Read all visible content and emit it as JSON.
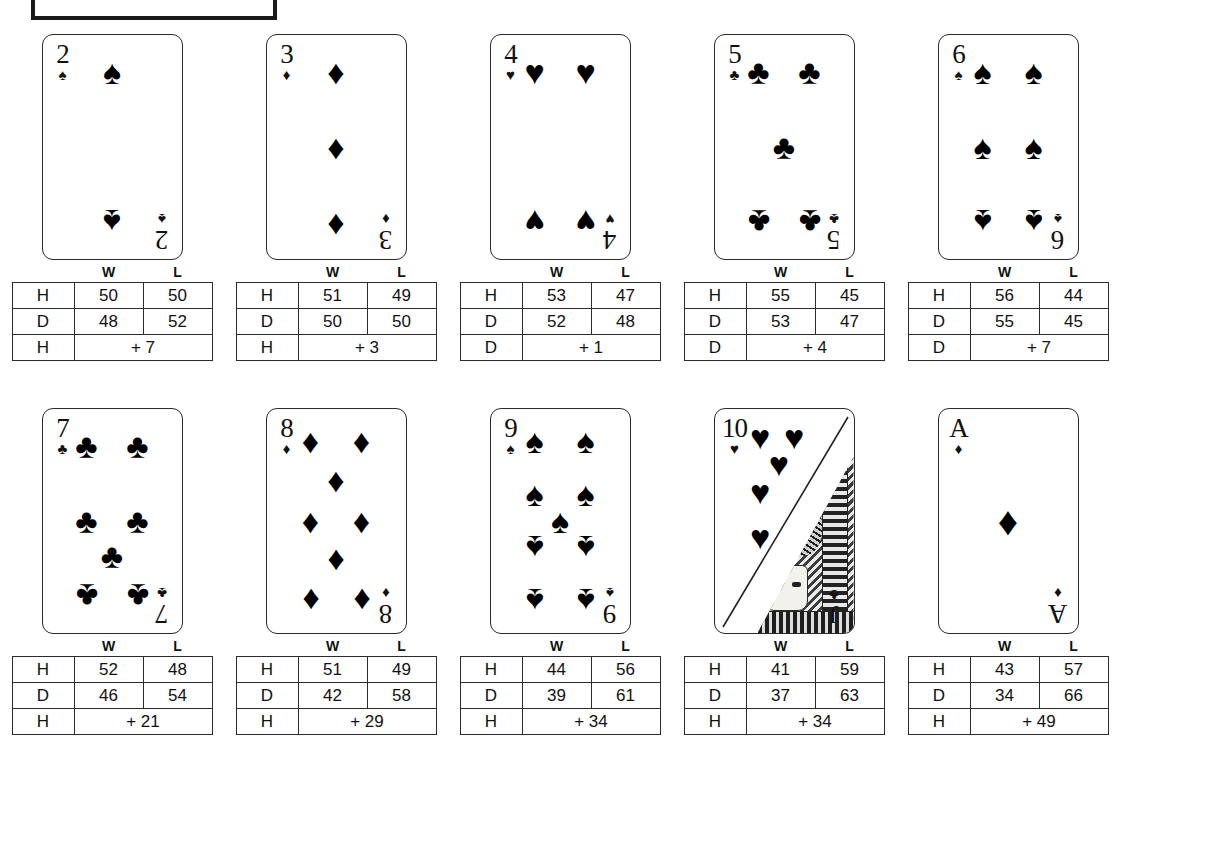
{
  "page": {
    "top_box": {
      "label": ""
    }
  },
  "table_headers": {
    "win": "W",
    "lose": "L"
  },
  "action_labels": {
    "hit": "H",
    "double": "D"
  },
  "cards": [
    {
      "rank": "2",
      "suit": "spade",
      "suit_glyph": "♠",
      "pip_count": 2,
      "layout": "two",
      "rows": [
        {
          "action": "H",
          "w": "50",
          "l": "50"
        },
        {
          "action": "D",
          "w": "48",
          "l": "52"
        }
      ],
      "best": {
        "action": "H",
        "edge": "+ 7"
      }
    },
    {
      "rank": "3",
      "suit": "diamond",
      "suit_glyph": "♦",
      "pip_count": 3,
      "layout": "three",
      "rows": [
        {
          "action": "H",
          "w": "51",
          "l": "49"
        },
        {
          "action": "D",
          "w": "50",
          "l": "50"
        }
      ],
      "best": {
        "action": "H",
        "edge": "+ 3"
      }
    },
    {
      "rank": "4",
      "suit": "heart",
      "suit_glyph": "♥",
      "pip_count": 4,
      "layout": "four",
      "rows": [
        {
          "action": "H",
          "w": "53",
          "l": "47"
        },
        {
          "action": "D",
          "w": "52",
          "l": "48"
        }
      ],
      "best": {
        "action": "D",
        "edge": "+ 1"
      }
    },
    {
      "rank": "5",
      "suit": "club",
      "suit_glyph": "♣",
      "pip_count": 5,
      "layout": "five",
      "rows": [
        {
          "action": "H",
          "w": "55",
          "l": "45"
        },
        {
          "action": "D",
          "w": "53",
          "l": "47"
        }
      ],
      "best": {
        "action": "D",
        "edge": "+ 4"
      }
    },
    {
      "rank": "6",
      "suit": "spade",
      "suit_glyph": "♠",
      "pip_count": 6,
      "layout": "six",
      "rows": [
        {
          "action": "H",
          "w": "56",
          "l": "44"
        },
        {
          "action": "D",
          "w": "55",
          "l": "45"
        }
      ],
      "best": {
        "action": "D",
        "edge": "+ 7"
      }
    },
    {
      "rank": "7",
      "suit": "club",
      "suit_glyph": "♣",
      "pip_count": 7,
      "layout": "seven",
      "rows": [
        {
          "action": "H",
          "w": "52",
          "l": "48"
        },
        {
          "action": "D",
          "w": "46",
          "l": "54"
        }
      ],
      "best": {
        "action": "H",
        "edge": "+ 21"
      }
    },
    {
      "rank": "8",
      "suit": "diamond",
      "suit_glyph": "♦",
      "pip_count": 8,
      "layout": "eight",
      "rows": [
        {
          "action": "H",
          "w": "51",
          "l": "49"
        },
        {
          "action": "D",
          "w": "42",
          "l": "58"
        }
      ],
      "best": {
        "action": "H",
        "edge": "+ 29"
      }
    },
    {
      "rank": "9",
      "suit": "spade",
      "suit_glyph": "♠",
      "pip_count": 9,
      "layout": "nine",
      "rows": [
        {
          "action": "H",
          "w": "44",
          "l": "56"
        },
        {
          "action": "D",
          "w": "39",
          "l": "61"
        }
      ],
      "best": {
        "action": "H",
        "edge": "+ 34"
      }
    },
    {
      "rank": "10",
      "suit": "heart",
      "suit_glyph": "♥",
      "pip_count": 10,
      "layout": "ten-face-split",
      "face_rank": "J",
      "face_suit_glyph": "♣",
      "rows": [
        {
          "action": "H",
          "w": "41",
          "l": "59"
        },
        {
          "action": "D",
          "w": "37",
          "l": "63"
        }
      ],
      "best": {
        "action": "H",
        "edge": "+ 34"
      }
    },
    {
      "rank": "A",
      "suit": "diamond",
      "suit_glyph": "♦",
      "pip_count": 1,
      "layout": "ace",
      "rows": [
        {
          "action": "H",
          "w": "43",
          "l": "57"
        },
        {
          "action": "D",
          "w": "34",
          "l": "66"
        }
      ],
      "best": {
        "action": "H",
        "edge": "+ 49"
      }
    }
  ]
}
